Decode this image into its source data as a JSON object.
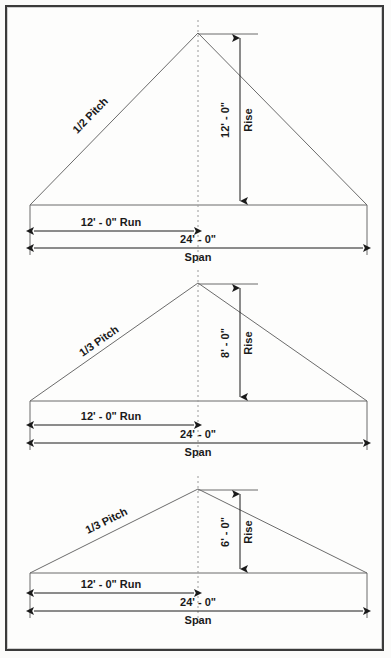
{
  "document": {
    "title": "Roof Pitch Diagrams",
    "frame_color": "#3a3a3a",
    "line_color": "#6b6b6b",
    "text_color": "#1a1a1a",
    "background": "#fdfdfc"
  },
  "diagrams": [
    {
      "id": "pitch-half",
      "pitch_label": "1/2 Pitch",
      "rise_value": "12' - 0\"",
      "rise_label": "Rise",
      "run_value": "12' - 0\"  Run",
      "span_value": "24' - 0\"",
      "span_label": "Span",
      "geometry": {
        "left_x": 30,
        "right_x": 367,
        "apex_x": 198,
        "base_y": 205,
        "apex_y": 33,
        "rise_arrow_x": 240,
        "run_dim_y": 231,
        "span_dim_y": 248
      }
    },
    {
      "id": "pitch-third-8",
      "pitch_label": "1/3 Pitch",
      "rise_value": "8' - 0\"",
      "rise_label": "Rise",
      "run_value": "12' - 0\"  Run",
      "span_value": "24' - 0\"",
      "span_label": "Span",
      "geometry": {
        "left_x": 30,
        "right_x": 367,
        "apex_x": 198,
        "base_y": 401,
        "apex_y": 283,
        "rise_arrow_x": 240,
        "run_dim_y": 425,
        "span_dim_y": 443
      }
    },
    {
      "id": "pitch-third-6",
      "pitch_label": "1/3 Pitch",
      "rise_value": "6' - 0\"",
      "rise_label": "Rise",
      "run_value": "12' - 0\"  Run",
      "span_value": "24' - 0\"",
      "span_label": "Span",
      "geometry": {
        "left_x": 30,
        "right_x": 367,
        "base_y": 573,
        "apex_x": 198,
        "apex_y": 489,
        "rise_arrow_x": 240,
        "run_dim_y": 593,
        "span_dim_y": 611
      }
    }
  ]
}
